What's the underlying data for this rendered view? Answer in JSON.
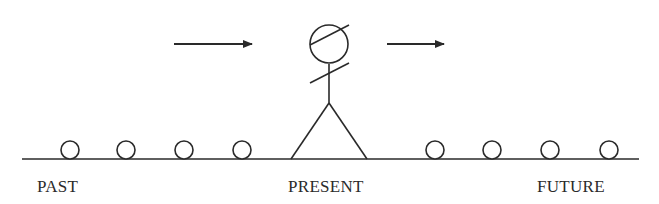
{
  "diagram": {
    "stroke_color": "#2a2a2a",
    "background": "#ffffff",
    "labels": {
      "past": "PAST",
      "present": "PRESENT",
      "future": "FUTURE"
    },
    "ground_line": {
      "x1": 22,
      "x2": 639,
      "y": 159
    },
    "past_events": [
      {
        "cx": 70,
        "cy": 150,
        "r": 9
      },
      {
        "cx": 126,
        "cy": 150,
        "r": 9
      },
      {
        "cx": 184,
        "cy": 150,
        "r": 9
      },
      {
        "cx": 242,
        "cy": 150,
        "r": 9
      }
    ],
    "future_events": [
      {
        "cx": 435,
        "cy": 150,
        "r": 9
      },
      {
        "cx": 492,
        "cy": 150,
        "r": 9
      },
      {
        "cx": 550,
        "cy": 150,
        "r": 9
      },
      {
        "cx": 609,
        "cy": 150,
        "r": 9
      }
    ],
    "arrows": [
      {
        "name": "arrow-toward-present",
        "x1": 174,
        "x2": 252,
        "y": 44,
        "direction": "right"
      },
      {
        "name": "arrow-toward-future",
        "x1": 387,
        "x2": 444,
        "y": 44,
        "direction": "right"
      }
    ],
    "figure": {
      "head": {
        "cx": 329,
        "cy": 44,
        "r": 19
      },
      "head_line": {
        "x1": 310,
        "y1": 45,
        "x2": 349,
        "y2": 25
      },
      "arm_line": {
        "x1": 310,
        "y1": 83,
        "x2": 349,
        "y2": 63
      },
      "body": {
        "x1": 329,
        "y1": 64,
        "x2": 329,
        "y2": 103
      },
      "left_leg": {
        "x1": 329,
        "y1": 103,
        "x2": 291,
        "y2": 159
      },
      "right_leg": {
        "x1": 329,
        "y1": 103,
        "x2": 367,
        "y2": 159
      }
    }
  }
}
